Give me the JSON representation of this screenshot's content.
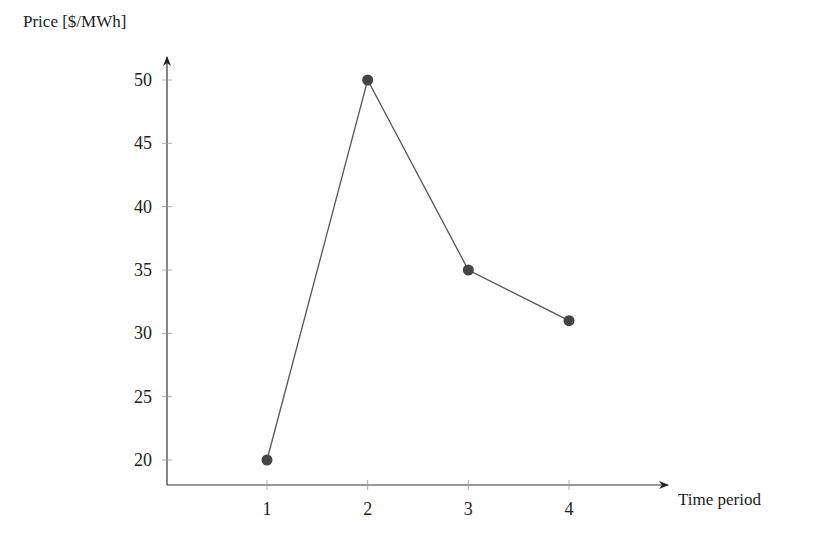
{
  "chart_data": {
    "type": "line",
    "title": "",
    "xlabel": "Time period",
    "ylabel": "Price [$/MWh]",
    "x": [
      1,
      2,
      3,
      4
    ],
    "categories": [
      "1",
      "2",
      "3",
      "4"
    ],
    "values": [
      20,
      50,
      35,
      31
    ],
    "series": [
      {
        "name": "Price",
        "values": [
          20,
          50,
          35,
          31
        ],
        "color": "#555555",
        "marker": "circle"
      }
    ],
    "xticks": [
      "1",
      "2",
      "3",
      "4"
    ],
    "yticks": [
      "20",
      "25",
      "30",
      "35",
      "40",
      "45",
      "50"
    ],
    "ylim": [
      18,
      52
    ],
    "xlim": [
      0,
      5
    ],
    "grid": false,
    "legend": null
  }
}
